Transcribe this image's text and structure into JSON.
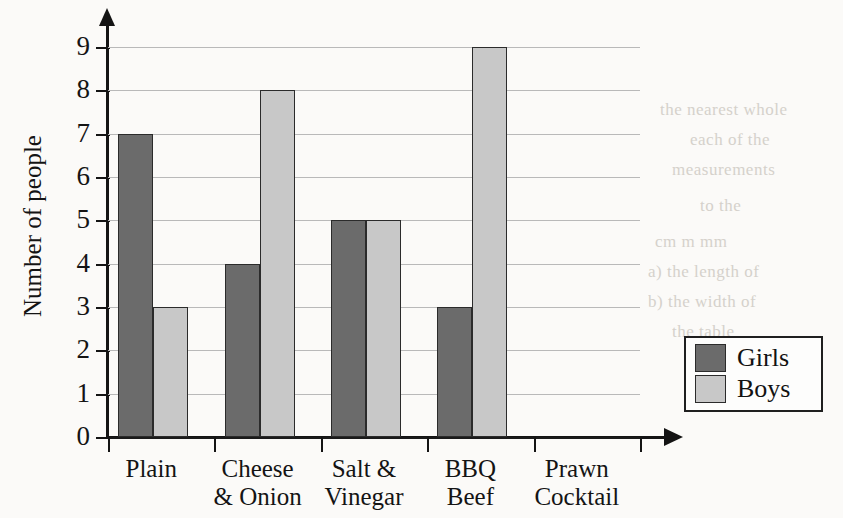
{
  "chart_data": {
    "type": "bar",
    "title": "",
    "xlabel": "",
    "ylabel": "Number of people",
    "ylim": [
      0,
      9
    ],
    "yticks": [
      0,
      1,
      2,
      3,
      4,
      5,
      6,
      7,
      8,
      9
    ],
    "grid": true,
    "legend_position": "right",
    "categories": [
      "Plain",
      "Cheese\n& Onion",
      "Salt &\nVinegar",
      "BBQ\nBeef",
      "Prawn\nCocktail"
    ],
    "category_lines": [
      [
        "Plain",
        ""
      ],
      [
        "Cheese",
        "& Onion"
      ],
      [
        "Salt &",
        "Vinegar"
      ],
      [
        "BBQ",
        "Beef"
      ],
      [
        "Prawn",
        "Cocktail"
      ]
    ],
    "series": [
      {
        "name": "Girls",
        "color": "#6b6b6b",
        "values": [
          7,
          4,
          5,
          3,
          0
        ]
      },
      {
        "name": "Boys",
        "color": "#c8c8c8",
        "values": [
          3,
          8,
          5,
          9,
          0
        ]
      }
    ]
  },
  "legend": {
    "entries": [
      {
        "label": "Girls",
        "color": "#6b6b6b"
      },
      {
        "label": "Boys",
        "color": "#c8c8c8"
      }
    ]
  },
  "axes": {
    "y_tick_labels": [
      "0",
      "1",
      "2",
      "3",
      "4",
      "5",
      "6",
      "7",
      "8",
      "9"
    ],
    "y_axis_title": "Number of people"
  },
  "background_bleed": [
    {
      "text": "the nearest whole",
      "x": 660,
      "y": 100
    },
    {
      "text": "each of the",
      "x": 690,
      "y": 130
    },
    {
      "text": "measurements",
      "x": 672,
      "y": 160
    },
    {
      "text": "to the",
      "x": 700,
      "y": 196
    },
    {
      "text": "cm     m     mm",
      "x": 655,
      "y": 232
    },
    {
      "text": "a) the length of",
      "x": 648,
      "y": 262
    },
    {
      "text": "b) the width of",
      "x": 648,
      "y": 292
    },
    {
      "text": "the table",
      "x": 672,
      "y": 322
    },
    {
      "text": "the circle",
      "x": 686,
      "y": 352
    },
    {
      "text": "measure",
      "x": 700,
      "y": 386
    }
  ]
}
